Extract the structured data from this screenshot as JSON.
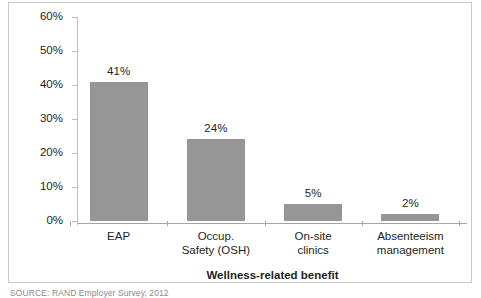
{
  "figure": {
    "source_note": "SOURCE: RAND Employer Survey, 2012"
  },
  "chart_data": {
    "type": "bar",
    "title": "",
    "categories": [
      "EAP",
      "Occup. Safety (OSH)",
      "On-site clinics",
      "Absenteeism management"
    ],
    "category_lines": [
      [
        "EAP"
      ],
      [
        "Occup.",
        "Safety (OSH)"
      ],
      [
        "On-site",
        "clinics"
      ],
      [
        "Absenteeism",
        "management"
      ]
    ],
    "values": [
      41,
      24,
      5,
      2
    ],
    "value_labels": [
      "41%",
      "24%",
      "5%",
      "2%"
    ],
    "xlabel": "Wellness-related benefit",
    "ylabel": "",
    "ylim": [
      0,
      60
    ],
    "yticks": [
      0,
      10,
      20,
      30,
      40,
      50,
      60
    ],
    "ytick_labels": [
      "0%",
      "10%",
      "20%",
      "30%",
      "40%",
      "50%",
      "60%"
    ],
    "grid": false,
    "legend": false,
    "bar_color": "#969696",
    "axis_color": "#bfbfbf"
  }
}
